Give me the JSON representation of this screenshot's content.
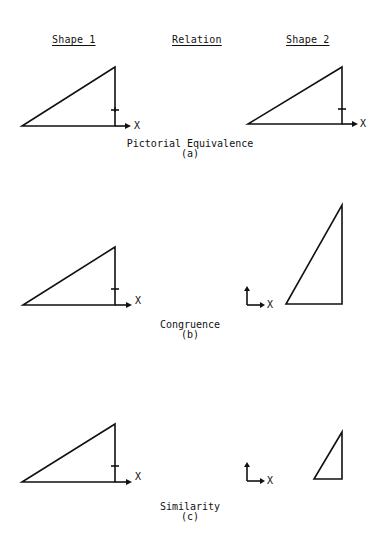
{
  "headers": {
    "shape1": "Shape 1",
    "relation": "Relation",
    "shape2": "Shape 2"
  },
  "panels": [
    {
      "id": "a",
      "relation": "Pictorial Equivalence",
      "tag": "(a)",
      "axis_label_left": "X",
      "axis_label_right": "X"
    },
    {
      "id": "b",
      "relation": "Congruence",
      "tag": "(b)",
      "axis_label_left": "X",
      "axis_label_right": "X"
    },
    {
      "id": "c",
      "relation": "Similarity",
      "tag": "(c)",
      "axis_label_left": "X",
      "axis_label_right": "X"
    }
  ],
  "colors": {
    "ink": "#111111",
    "background": "#ffffff"
  }
}
